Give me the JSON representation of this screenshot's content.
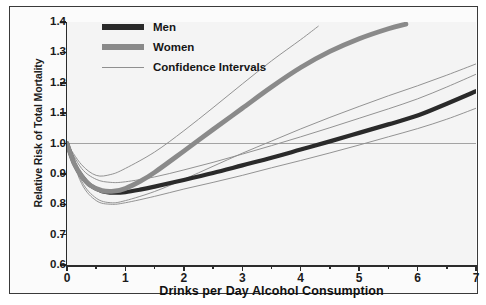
{
  "chart_data": {
    "type": "line",
    "title": "",
    "xlabel": "Drinks per Day Alcohol Consumption",
    "ylabel": "Relative Risk of Total Mortality",
    "xlim": [
      0,
      7
    ],
    "ylim": [
      0.6,
      1.4
    ],
    "xticks": [
      0,
      1,
      2,
      3,
      4,
      5,
      6,
      7
    ],
    "xtick_labels": [
      "0",
      "1",
      "2",
      "3",
      "4",
      "5",
      "6",
      "7"
    ],
    "xminor_step": 0.5,
    "yticks": [
      0.6,
      0.7,
      0.8,
      0.9,
      1.0,
      1.1,
      1.2,
      1.3,
      1.4
    ],
    "ytick_labels": [
      "0.6",
      "0.7",
      "0.8",
      "0.9",
      "1.0",
      "1.1",
      "1.2",
      "1.3",
      "1.4"
    ],
    "grid": false,
    "reference_line": {
      "y": 1.0,
      "label": "1.0"
    },
    "legend_position": "top-left",
    "legend": [
      {
        "name": "Men",
        "style": "thick-black"
      },
      {
        "name": "Women",
        "style": "thick-gray"
      },
      {
        "name": "Confidence Intervals",
        "style": "thin-line"
      }
    ],
    "series": [
      {
        "name": "Men",
        "color": "#2a2a2a",
        "width": 4.2,
        "x": [
          0,
          0.12,
          0.25,
          0.4,
          0.6,
          0.8,
          1.0,
          1.25,
          1.5,
          2.0,
          2.5,
          3.0,
          3.5,
          4.0,
          4.5,
          5.0,
          5.5,
          6.0,
          6.5,
          7.0
        ],
        "y": [
          1.0,
          0.935,
          0.893,
          0.862,
          0.843,
          0.838,
          0.84,
          0.848,
          0.858,
          0.88,
          0.903,
          0.928,
          0.953,
          0.98,
          1.007,
          1.035,
          1.063,
          1.092,
          1.131,
          1.172
        ]
      },
      {
        "name": "Women",
        "color": "#8a8a8a",
        "width": 4.8,
        "x": [
          0,
          0.12,
          0.25,
          0.4,
          0.6,
          0.8,
          1.0,
          1.25,
          1.5,
          2.0,
          2.5,
          3.0,
          3.5,
          4.0,
          4.5,
          5.0,
          5.5,
          5.8
        ],
        "y": [
          1.0,
          0.935,
          0.893,
          0.862,
          0.845,
          0.843,
          0.852,
          0.875,
          0.905,
          0.975,
          1.046,
          1.116,
          1.186,
          1.25,
          1.303,
          1.345,
          1.378,
          1.393
        ]
      }
    ],
    "confidence_intervals": [
      {
        "name": "Men upper",
        "x": [
          0,
          0.25,
          0.5,
          0.75,
          1.0,
          1.5,
          2.0,
          2.5,
          3.0,
          3.5,
          4.0,
          4.5,
          5.0,
          5.5,
          6.0,
          6.5,
          7.0
        ],
        "y": [
          1.0,
          0.918,
          0.882,
          0.872,
          0.874,
          0.89,
          0.913,
          0.938,
          0.965,
          0.993,
          1.022,
          1.052,
          1.083,
          1.114,
          1.147,
          1.186,
          1.228
        ]
      },
      {
        "name": "Men lower",
        "x": [
          0,
          0.25,
          0.5,
          0.75,
          1.0,
          1.5,
          2.0,
          2.5,
          3.0,
          3.5,
          4.0,
          4.5,
          5.0,
          5.5,
          6.0,
          6.5,
          7.0
        ],
        "y": [
          1.0,
          0.868,
          0.812,
          0.8,
          0.805,
          0.826,
          0.85,
          0.872,
          0.895,
          0.92,
          0.944,
          0.969,
          0.995,
          1.022,
          1.049,
          1.08,
          1.116
        ]
      },
      {
        "name": "Women upper",
        "x": [
          0,
          0.25,
          0.5,
          0.75,
          1.0,
          1.5,
          2.0,
          2.5,
          3.0,
          3.5,
          4.0,
          4.3
        ],
        "y": [
          1.0,
          0.93,
          0.895,
          0.898,
          0.918,
          0.972,
          1.042,
          1.118,
          1.196,
          1.272,
          1.342,
          1.386
        ]
      },
      {
        "name": "Women lower",
        "x": [
          0,
          0.25,
          0.5,
          0.75,
          1.0,
          1.5,
          2.0,
          2.5,
          3.0,
          3.5,
          4.0,
          4.5,
          5.0,
          5.5,
          6.0,
          6.5,
          7.0
        ],
        "y": [
          1.0,
          0.876,
          0.82,
          0.805,
          0.812,
          0.842,
          0.882,
          0.925,
          0.968,
          1.008,
          1.048,
          1.086,
          1.122,
          1.157,
          1.19,
          1.225,
          1.262
        ]
      }
    ]
  },
  "axes": {
    "ylabel": "Relative Risk of Total Mortality",
    "xlabel": "Drinks per Day Alcohol Consumption",
    "ytick_labels": [
      "1.4",
      "1.3",
      "1.2",
      "1.1",
      "1.0",
      "0.9",
      "0.8",
      "0.7",
      "0.6"
    ],
    "xtick_labels": [
      "0",
      "1",
      "2",
      "3",
      "4",
      "5",
      "6",
      "7"
    ]
  },
  "legend": {
    "items": [
      {
        "label": "Men"
      },
      {
        "label": "Women"
      },
      {
        "label": "Confidence Intervals"
      }
    ]
  }
}
